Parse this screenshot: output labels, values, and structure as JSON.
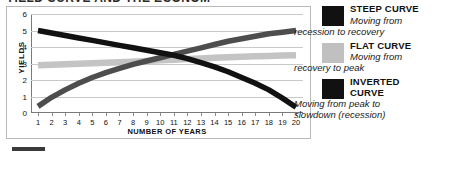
{
  "figure": {
    "title_sliver": "YIELD CURVE AND THE ECONOMY"
  },
  "chart_data": {
    "type": "line",
    "title": "",
    "xlabel": "NUMBER OF YEARS",
    "ylabel": "YIELDS",
    "xlim": [
      1,
      20
    ],
    "ylim": [
      0,
      6
    ],
    "grid": true,
    "legend_position": "right",
    "x": [
      1,
      2,
      3,
      4,
      5,
      6,
      7,
      8,
      9,
      10,
      11,
      12,
      13,
      14,
      15,
      16,
      17,
      18,
      19,
      20
    ],
    "xticks": [
      "1",
      "2",
      "3",
      "4",
      "5",
      "6",
      "7",
      "8",
      "9",
      "10",
      "11",
      "12",
      "13",
      "14",
      "15",
      "16",
      "17",
      "18",
      "19",
      "20"
    ],
    "yticks": [
      "0",
      "1",
      "2",
      "3",
      "4",
      "5",
      "6"
    ],
    "series": [
      {
        "name": "STEEP CURVE",
        "color": "#4d4d4d",
        "values": [
          0.4,
          0.95,
          1.4,
          1.8,
          2.15,
          2.45,
          2.7,
          2.95,
          3.15,
          3.35,
          3.55,
          3.75,
          3.95,
          4.15,
          4.35,
          4.5,
          4.65,
          4.8,
          4.9,
          5.0
        ]
      },
      {
        "name": "FLAT CURVE",
        "color": "#c4c4c4",
        "values": [
          2.9,
          2.93,
          2.96,
          2.99,
          3.02,
          3.05,
          3.08,
          3.11,
          3.15,
          3.19,
          3.23,
          3.27,
          3.31,
          3.35,
          3.38,
          3.41,
          3.44,
          3.46,
          3.48,
          3.5
        ]
      },
      {
        "name": "INVERTED CURVE",
        "color": "#111111",
        "values": [
          5.0,
          4.85,
          4.7,
          4.55,
          4.4,
          4.25,
          4.1,
          3.95,
          3.8,
          3.65,
          3.5,
          3.3,
          3.05,
          2.8,
          2.5,
          2.15,
          1.8,
          1.4,
          0.9,
          0.35
        ]
      }
    ]
  },
  "legend": {
    "items": [
      {
        "label": "STEEP CURVE",
        "desc_line1": "Moving from",
        "desc_line2": "recession to recovery",
        "color": "#111111"
      },
      {
        "label": "FLAT CURVE",
        "desc_line1": "Moving from",
        "desc_line2": "recovery to peak",
        "color": "#c0c0c0"
      },
      {
        "label": "INVERTED",
        "label2": "CURVE",
        "desc_line1": "Moving from peak to",
        "desc_line2": "slowdown (recession)",
        "color": "#111111"
      }
    ]
  }
}
